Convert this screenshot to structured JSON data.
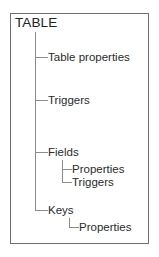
{
  "diagram": {
    "type": "tree-hierarchy",
    "title": "TABLE",
    "frame": {
      "border_color": "#6f6f6f",
      "background": "#ffffff"
    },
    "line_color": "#8c8c8c",
    "text_color": "#2b2b2b",
    "root": {
      "label": "TABLE",
      "children": [
        {
          "label": "Table properties",
          "children": []
        },
        {
          "label": "Triggers",
          "children": []
        },
        {
          "label": "Fields",
          "children": [
            {
              "label": "Properties",
              "children": []
            },
            {
              "label": "Triggers",
              "children": []
            }
          ]
        },
        {
          "label": "Keys",
          "children": [
            {
              "label": "Properties",
              "children": []
            }
          ]
        }
      ]
    },
    "nodes": {
      "root": "TABLE",
      "table_properties": "Table properties",
      "triggers": "Triggers",
      "fields": "Fields",
      "fields_properties": "Properties",
      "fields_triggers": "Triggers",
      "keys": "Keys",
      "keys_properties": "Properties"
    }
  }
}
